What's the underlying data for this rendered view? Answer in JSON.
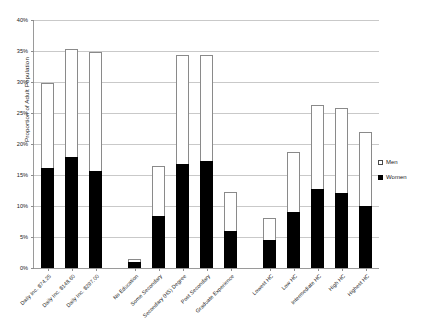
{
  "chart_data": {
    "type": "bar",
    "title": "",
    "subtitle": "",
    "xlabel": "",
    "ylabel": "Proportion of Adult Population",
    "ylim": [
      0,
      40
    ],
    "ytick_labels": [
      "0%",
      "5%",
      "10%",
      "15%",
      "20%",
      "25%",
      "30%",
      "35%",
      "40%"
    ],
    "ytick_values": [
      0,
      5,
      10,
      15,
      20,
      25,
      30,
      35,
      40
    ],
    "grid": true,
    "stacked": true,
    "legend_position": "right",
    "categories": [
      "Daily Inc. $74.25",
      "Daily Inc. $148.60",
      "Daily Inc. $297.00",
      "No Education",
      "Some Secondary",
      "Secondary (HS) Degree",
      "Post Secondary",
      "Graduate Experience",
      "Lowest HC",
      "Low HC",
      "Intermediate HC",
      "High HC",
      "Highest HC"
    ],
    "groups": [
      {
        "name": "Daily Income",
        "categories": [
          "Daily Inc. $74.25",
          "Daily Inc. $148.60",
          "Daily Inc. $297.00"
        ]
      },
      {
        "name": "Education",
        "categories": [
          "No Education",
          "Some Secondary",
          "Secondary (HS) Degree",
          "Post Secondary",
          "Graduate Experience"
        ]
      },
      {
        "name": "Human Capital",
        "categories": [
          "Lowest HC",
          "Low HC",
          "Intermediate HC",
          "High HC",
          "Highest HC"
        ]
      }
    ],
    "series": [
      {
        "name": "Women",
        "color": "#000000",
        "values": [
          16.2,
          17.9,
          15.7,
          1.0,
          8.4,
          16.8,
          17.2,
          6.0,
          4.5,
          9.0,
          12.8,
          12.1,
          10.0
        ]
      },
      {
        "name": "Men",
        "color": "#ffffff",
        "values": [
          13.6,
          17.4,
          19.2,
          0.5,
          8.1,
          17.6,
          17.2,
          6.3,
          3.5,
          9.7,
          13.5,
          13.7,
          12.0
        ]
      }
    ],
    "totals": [
      29.8,
      35.3,
      34.9,
      1.5,
      16.5,
      34.4,
      34.4,
      12.3,
      8.0,
      18.7,
      26.3,
      25.8,
      22.0
    ]
  },
  "legend": {
    "items": [
      {
        "label": "Men",
        "swatch": "open-square"
      },
      {
        "label": "Women",
        "swatch": "filled-square"
      }
    ]
  }
}
